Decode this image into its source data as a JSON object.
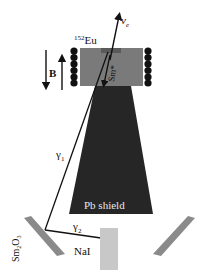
{
  "diagram": {
    "labels": {
      "source": "Eu",
      "source_mass": "152",
      "neutrino": "ν",
      "neutrino_sub": "e",
      "field": "B",
      "excited": "Sm*",
      "gamma1": "γ",
      "gamma1_sub": "1",
      "gamma2": "γ",
      "gamma2_sub": "2",
      "shield": "Pb shield",
      "scatterer": "Sm",
      "scatterer_sub1": "2",
      "scatterer_mid": "O",
      "scatterer_sub2": "3",
      "detector": "NaI"
    },
    "colors": {
      "source_box": "#7a7a7a",
      "source_strip": "#5a5a5a",
      "shield": "#262626",
      "scatterer": "#8a8a8a",
      "detector": "#c8c8c8",
      "coil": "#111111",
      "line": "#111111"
    }
  }
}
